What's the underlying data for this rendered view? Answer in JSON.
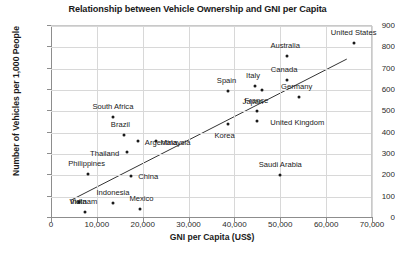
{
  "chart_data": {
    "type": "scatter",
    "title": "Relationship between Vehicle Ownership and GNI per Capita",
    "xlabel": "GNI per Capita (US$)",
    "ylabel": "Number of Vehicles per 1,000 People",
    "xlim": [
      0,
      70000
    ],
    "ylim": [
      0,
      900
    ],
    "xticks": [
      0,
      10000,
      20000,
      30000,
      40000,
      50000,
      60000,
      70000
    ],
    "xtick_labels": [
      "0",
      "10,000",
      "20,000",
      "30,000",
      "40,000",
      "50,000",
      "60,000",
      "70,000"
    ],
    "yticks": [
      0,
      100,
      200,
      300,
      400,
      500,
      600,
      700,
      800,
      900
    ],
    "ytick_labels": [
      "0",
      "100",
      "200",
      "300",
      "400",
      "500",
      "600",
      "700",
      "800",
      "900"
    ],
    "grid": true,
    "legend": false,
    "marker_color": "#1a1a1a",
    "trendline_color": "#333333",
    "trendline": {
      "x0": 4500,
      "y0": 85,
      "x1": 64500,
      "y1": 745
    },
    "points": [
      {
        "label": "United States",
        "x": 66000,
        "y": 820,
        "label_dx": 0,
        "label_dy": -11
      },
      {
        "label": "Australia",
        "x": 51500,
        "y": 760,
        "label_dx": -2,
        "label_dy": -11
      },
      {
        "label": "Canada",
        "x": 51500,
        "y": 645,
        "label_dx": -3,
        "label_dy": -11
      },
      {
        "label": "Italy",
        "x": 44500,
        "y": 620,
        "label_dx": -2,
        "label_dy": -11
      },
      {
        "label": "Spain",
        "x": 38500,
        "y": 595,
        "label_dx": -1,
        "label_dy": -11
      },
      {
        "label": "Japan",
        "x": 46000,
        "y": 600,
        "label_dx": -9,
        "label_dy": 11
      },
      {
        "label": "Germany",
        "x": 54000,
        "y": 565,
        "label_dx": -2,
        "label_dy": -11
      },
      {
        "label": "France",
        "x": 45000,
        "y": 500,
        "label_dx": -1,
        "label_dy": -11
      },
      {
        "label": "United Kingdom",
        "x": 45000,
        "y": 455,
        "label_dx": 40,
        "label_dy": 1
      },
      {
        "label": "Korea",
        "x": 38500,
        "y": 440,
        "label_dx": -3,
        "label_dy": 11
      },
      {
        "label": "South Africa",
        "x": 13500,
        "y": 475,
        "label_dx": 0,
        "label_dy": -11
      },
      {
        "label": "Brazil",
        "x": 16000,
        "y": 390,
        "label_dx": -4,
        "label_dy": -11
      },
      {
        "label": "Argentina",
        "x": 19000,
        "y": 360,
        "label_dx": 23,
        "label_dy": 1
      },
      {
        "label": "Malaysia",
        "x": 23000,
        "y": 360,
        "label_dx": 19,
        "label_dy": 1
      },
      {
        "label": "Thailand",
        "x": 16500,
        "y": 310,
        "label_dx": -22,
        "label_dy": 1
      },
      {
        "label": "Saudi Arabia",
        "x": 50000,
        "y": 200,
        "label_dx": 0,
        "label_dy": -11
      },
      {
        "label": "Philippines",
        "x": 8000,
        "y": 205,
        "label_dx": -1,
        "label_dy": -11
      },
      {
        "label": "China",
        "x": 17500,
        "y": 195,
        "label_dx": 17,
        "label_dy": 0
      },
      {
        "label": "Indonesia",
        "x": 13500,
        "y": 70,
        "label_dx": 0,
        "label_dy": -11
      },
      {
        "label": "Mexico",
        "x": 19500,
        "y": 40,
        "label_dx": 1,
        "label_dy": -11
      },
      {
        "label": "India",
        "x": 6000,
        "y": 75,
        "label_dx": 0,
        "label_dy": -1
      },
      {
        "label": "Vietnam",
        "x": 7500,
        "y": 30,
        "label_dx": -2,
        "label_dy": -11
      }
    ]
  }
}
